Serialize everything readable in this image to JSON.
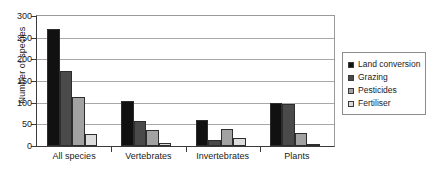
{
  "chart_data": {
    "type": "bar",
    "title": "",
    "xlabel": "",
    "ylabel": "Number of species",
    "ylim": [
      0,
      300
    ],
    "yticks": [
      0,
      50,
      100,
      150,
      200,
      250,
      300
    ],
    "ytick_labels": [
      "0",
      "50",
      "100",
      "150",
      "200",
      "250",
      "300"
    ],
    "grid": true,
    "legend_position": "right",
    "categories": [
      "All species",
      "Vertebrates",
      "Invertebrates",
      "Plants"
    ],
    "series": [
      {
        "name": "Land conversion",
        "color": "#111111",
        "values": [
          270,
          105,
          60,
          100
        ]
      },
      {
        "name": "Grazing",
        "color": "#4a4a4a",
        "values": [
          172,
          57,
          15,
          97
        ]
      },
      {
        "name": "Pesticides",
        "color": "#a2a2a2",
        "values": [
          114,
          37,
          40,
          30
        ]
      },
      {
        "name": "Fertiliser",
        "color": "#dcdcdc",
        "values": [
          28,
          8,
          18,
          2
        ]
      }
    ]
  }
}
